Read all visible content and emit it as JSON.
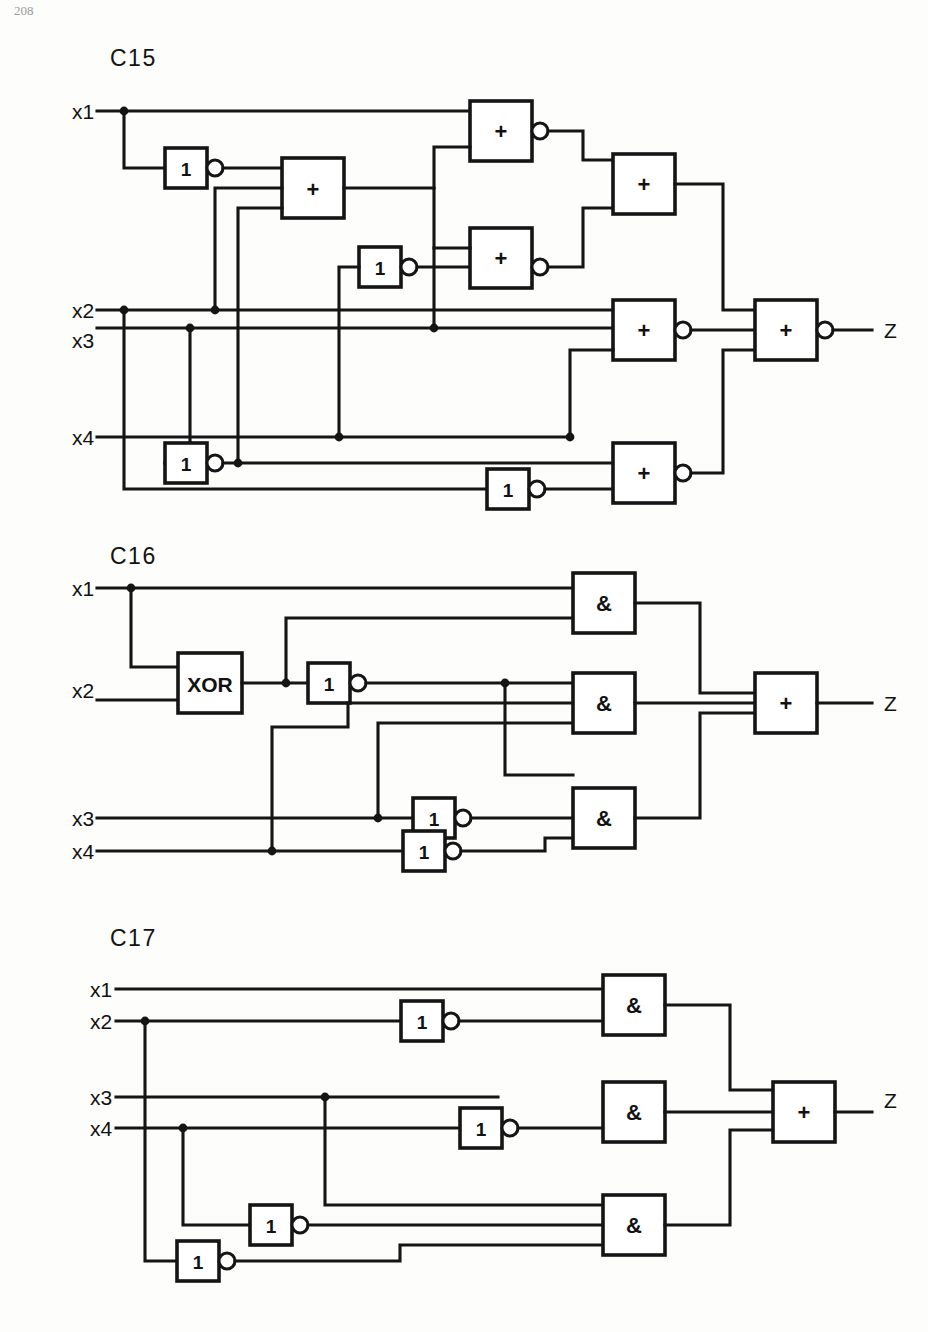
{
  "page": {
    "folio": "208",
    "background": "#fdfdfc",
    "ink": "#151515"
  },
  "circuits": [
    {
      "id": "c15",
      "title": "C15",
      "inputs": [
        "x1",
        "x2",
        "x3",
        "x4"
      ],
      "output": "Z",
      "gate_symbols": {
        "or": "+",
        "and": "&",
        "inverter": "1",
        "xor": "XOR"
      },
      "gates": [
        {
          "name": "inv-a",
          "type": "inverter",
          "label": "1",
          "inverted_output": true
        },
        {
          "name": "or-a",
          "type": "or",
          "label": "+",
          "inverted_output": false
        },
        {
          "name": "inv-b",
          "type": "inverter",
          "label": "1",
          "inverted_output": true
        },
        {
          "name": "or-b",
          "type": "or",
          "label": "+",
          "inverted_output": true
        },
        {
          "name": "or-c",
          "type": "or",
          "label": "+",
          "inverted_output": true
        },
        {
          "name": "or-d",
          "type": "or",
          "label": "+",
          "inverted_output": false
        },
        {
          "name": "or-e",
          "type": "or",
          "label": "+",
          "inverted_output": true
        },
        {
          "name": "inv-c",
          "type": "inverter",
          "label": "1",
          "inverted_output": true
        },
        {
          "name": "inv-d",
          "type": "inverter",
          "label": "1",
          "inverted_output": true
        },
        {
          "name": "or-f",
          "type": "or",
          "label": "+",
          "inverted_output": true
        },
        {
          "name": "or-out",
          "type": "or",
          "label": "+",
          "inverted_output": true
        }
      ]
    },
    {
      "id": "c16",
      "title": "C16",
      "inputs": [
        "x1",
        "x2",
        "x3",
        "x4"
      ],
      "output": "Z",
      "gate_symbols": {
        "or": "+",
        "and": "&",
        "inverter": "1",
        "xor": "XOR"
      },
      "gates": [
        {
          "name": "xor-a",
          "type": "xor",
          "label": "XOR",
          "inverted_output": false
        },
        {
          "name": "inv-a",
          "type": "inverter",
          "label": "1",
          "inverted_output": true
        },
        {
          "name": "inv-b",
          "type": "inverter",
          "label": "1",
          "inverted_output": true
        },
        {
          "name": "inv-c",
          "type": "inverter",
          "label": "1",
          "inverted_output": true
        },
        {
          "name": "and-a",
          "type": "and",
          "label": "&",
          "inverted_output": false
        },
        {
          "name": "and-b",
          "type": "and",
          "label": "&",
          "inverted_output": false
        },
        {
          "name": "and-c",
          "type": "and",
          "label": "&",
          "inverted_output": false
        },
        {
          "name": "or-out",
          "type": "or",
          "label": "+",
          "inverted_output": false
        }
      ]
    },
    {
      "id": "c17",
      "title": "C17",
      "inputs": [
        "x1",
        "x2",
        "x3",
        "x4"
      ],
      "output": "Z",
      "gate_symbols": {
        "or": "+",
        "and": "&",
        "inverter": "1",
        "xor": "XOR"
      },
      "gates": [
        {
          "name": "inv-a",
          "type": "inverter",
          "label": "1",
          "inverted_output": true
        },
        {
          "name": "inv-b",
          "type": "inverter",
          "label": "1",
          "inverted_output": true
        },
        {
          "name": "inv-c",
          "type": "inverter",
          "label": "1",
          "inverted_output": true
        },
        {
          "name": "inv-d",
          "type": "inverter",
          "label": "1",
          "inverted_output": true
        },
        {
          "name": "and-a",
          "type": "and",
          "label": "&",
          "inverted_output": false
        },
        {
          "name": "and-b",
          "type": "and",
          "label": "&",
          "inverted_output": false
        },
        {
          "name": "and-c",
          "type": "and",
          "label": "&",
          "inverted_output": false
        },
        {
          "name": "or-out",
          "type": "or",
          "label": "+",
          "inverted_output": false
        }
      ]
    }
  ],
  "labels": {
    "c15": {
      "title": "C15",
      "x1": "x1",
      "x2": "x2",
      "x3": "x3",
      "x4": "x4",
      "z": "Z",
      "inv_a": "1",
      "inv_b": "1",
      "inv_c": "1",
      "inv_d": "1",
      "or_a": "+",
      "or_b": "+",
      "or_c": "+",
      "or_d": "+",
      "or_e": "+",
      "or_f": "+",
      "or_out": "+"
    },
    "c16": {
      "title": "C16",
      "x1": "x1",
      "x2": "x2",
      "x3": "x3",
      "x4": "x4",
      "z": "Z",
      "xor_a": "XOR",
      "inv_a": "1",
      "inv_b": "1",
      "inv_c": "1",
      "and_a": "&",
      "and_b": "&",
      "and_c": "&",
      "or_out": "+"
    },
    "c17": {
      "title": "C17",
      "x1": "x1",
      "x2": "x2",
      "x3": "x3",
      "x4": "x4",
      "z": "Z",
      "inv_a": "1",
      "inv_b": "1",
      "inv_c": "1",
      "inv_d": "1",
      "and_a": "&",
      "and_b": "&",
      "and_c": "&",
      "or_out": "+"
    },
    "folio": "208"
  }
}
